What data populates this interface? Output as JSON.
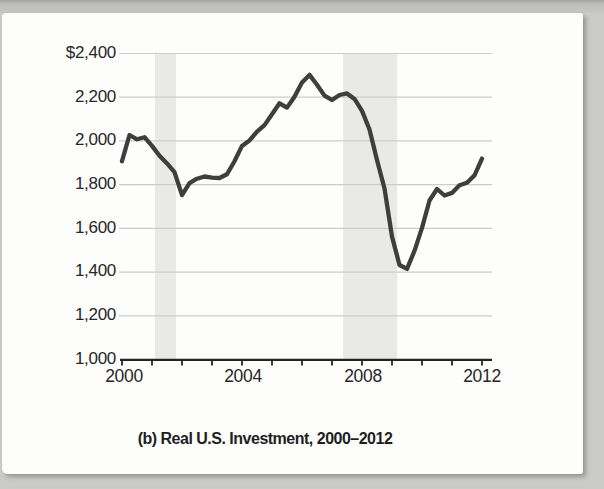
{
  "figure": {
    "caption": "(b) Real U.S. Investment, 2000–2012"
  },
  "chart_data": {
    "type": "line",
    "title": "(b) Real U.S. Investment, 2000–2012",
    "xlabel": "",
    "ylabel": "",
    "unit_prefix": "$",
    "grid": "horizontal",
    "legend": "none",
    "xlim": [
      2000,
      2012.35
    ],
    "ylim": [
      1000,
      2400
    ],
    "x_tick_labels": [
      "2000",
      "2004",
      "2008",
      "2012"
    ],
    "x_tick_values": [
      2000,
      2004,
      2008,
      2012
    ],
    "minor_x_tick_step_years": 1,
    "y_tick_labels": [
      "$2,400",
      "2,200",
      "2,000",
      "1,800",
      "1,600",
      "1,400",
      "1,200",
      "1,000"
    ],
    "y_tick_values": [
      2400,
      2200,
      2000,
      1800,
      1600,
      1400,
      1200,
      1000
    ],
    "recession_bands_years": [
      [
        2001.1,
        2001.8
      ],
      [
        2007.37,
        2009.17
      ]
    ],
    "x": [
      2000.0,
      2000.25,
      2000.5,
      2000.75,
      2001.0,
      2001.25,
      2001.5,
      2001.75,
      2002.0,
      2002.25,
      2002.5,
      2002.75,
      2003.0,
      2003.25,
      2003.5,
      2003.75,
      2004.0,
      2004.25,
      2004.5,
      2004.75,
      2005.0,
      2005.25,
      2005.5,
      2005.75,
      2006.0,
      2006.25,
      2006.5,
      2006.75,
      2007.0,
      2007.25,
      2007.5,
      2007.75,
      2008.0,
      2008.25,
      2008.5,
      2008.75,
      2009.0,
      2009.25,
      2009.5,
      2009.75,
      2010.0,
      2010.25,
      2010.5,
      2010.75,
      2011.0,
      2011.25,
      2011.5,
      2011.75,
      2012.0
    ],
    "series": [
      {
        "name": "Real U.S. Investment",
        "values": [
          1905,
          2025,
          2005,
          2015,
          1975,
          1930,
          1895,
          1855,
          1750,
          1805,
          1825,
          1835,
          1830,
          1828,
          1845,
          1905,
          1975,
          2000,
          2040,
          2070,
          2120,
          2170,
          2150,
          2200,
          2265,
          2300,
          2255,
          2205,
          2185,
          2208,
          2215,
          2190,
          2135,
          2050,
          1910,
          1780,
          1560,
          1430,
          1412,
          1495,
          1600,
          1725,
          1778,
          1748,
          1760,
          1795,
          1806,
          1840,
          1917
        ]
      }
    ],
    "colors": {
      "line": "#3e3e3e",
      "recession_band": "#e9e9e6",
      "gridline": "#cccccb",
      "axis": "#242424",
      "text": "#272727",
      "panel_background": "#fdfdfb",
      "page_background": "#cbccc8"
    }
  }
}
